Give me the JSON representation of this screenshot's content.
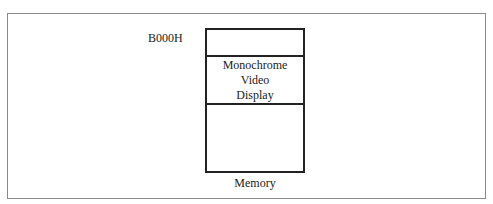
{
  "diagram": {
    "address_label": "B000H",
    "segments": [
      {
        "label_lines": []
      },
      {
        "label_lines": [
          "Monochrome",
          "Video",
          "Display"
        ]
      },
      {
        "label_lines": []
      }
    ],
    "caption": "Memory"
  }
}
